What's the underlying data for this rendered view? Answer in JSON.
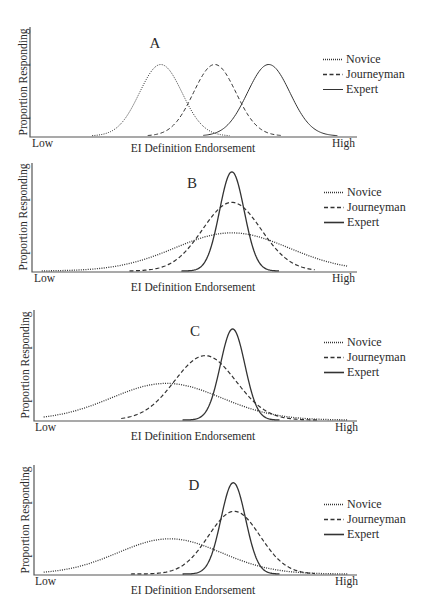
{
  "figure": {
    "width": 427,
    "height": 612
  },
  "colors": {
    "ink": "#333333",
    "axis": "#555555",
    "background": "#ffffff"
  },
  "chart_data": [
    {
      "type": "line",
      "panel": "A",
      "title": "A",
      "xlabel": "EI Definition Endorsement",
      "ylabel": "Proportion Responding",
      "x_tick_labels": [
        "Low",
        "High"
      ],
      "legend": [
        "Novice",
        "Journeyman",
        "Expert"
      ],
      "legend_position": "right",
      "grid": false,
      "xlim": [
        0,
        1
      ],
      "ylim": [
        0,
        1
      ],
      "frame": {
        "axis_x": 30,
        "axis_top": 27,
        "axis_bottom": 137,
        "axis_right": 357,
        "label_x": 155,
        "label_y": 48,
        "low_x": 32,
        "low_y": 147,
        "high_x": 355,
        "high_y": 147,
        "xlabel_x": 193,
        "xlabel_y": 152,
        "ylabel_x": 27,
        "ylabel_y": 82,
        "legend_x": 323,
        "legend_y": 63,
        "legend_dy": 15
      },
      "series": [
        {
          "name": "Novice",
          "style": "dotted",
          "mean": 0.4,
          "sd": 0.065,
          "peak": 0.65,
          "from": 0.19,
          "to": 0.61,
          "width": 1.0
        },
        {
          "name": "Journeyman",
          "style": "dashed",
          "mean": 0.565,
          "sd": 0.065,
          "peak": 0.65,
          "from": 0.36,
          "to": 0.77,
          "width": 1.0
        },
        {
          "name": "Expert",
          "style": "solid",
          "mean": 0.73,
          "sd": 0.065,
          "peak": 0.65,
          "from": 0.53,
          "to": 0.94,
          "width": 1.0
        }
      ]
    },
    {
      "type": "line",
      "panel": "B",
      "title": "B",
      "xlabel": "EI Definition Endorsement",
      "ylabel": "Proportion Responding",
      "x_tick_labels": [
        "Low",
        "High"
      ],
      "legend": [
        "Novice",
        "Journeyman",
        "Expert"
      ],
      "legend_position": "right",
      "grid": false,
      "xlim": [
        0,
        1
      ],
      "ylim": [
        0,
        1
      ],
      "frame": {
        "axis_x": 32,
        "axis_top": 163,
        "axis_bottom": 272,
        "axis_right": 357,
        "label_x": 192,
        "label_y": 188,
        "low_x": 34,
        "low_y": 282,
        "high_x": 355,
        "high_y": 282,
        "xlabel_x": 193,
        "xlabel_y": 291,
        "ylabel_x": 27,
        "ylabel_y": 217,
        "legend_x": 324,
        "legend_y": 196,
        "legend_dy": 15
      },
      "series": [
        {
          "name": "Novice",
          "style": "dotted",
          "mean": 0.615,
          "sd": 0.175,
          "peak": 0.35,
          "from": 0.03,
          "to": 0.97,
          "width": 1.3
        },
        {
          "name": "Journeyman",
          "style": "dashed",
          "mean": 0.615,
          "sd": 0.09,
          "peak": 0.63,
          "from": 0.3,
          "to": 0.87,
          "width": 1.2
        },
        {
          "name": "Expert",
          "style": "solid",
          "mean": 0.615,
          "sd": 0.038,
          "peak": 0.91,
          "from": 0.46,
          "to": 0.76,
          "width": 1.3
        }
      ]
    },
    {
      "type": "line",
      "panel": "C",
      "title": "C",
      "xlabel": "EI Definition Endorsement",
      "ylabel": "Proportion Responding",
      "x_tick_labels": [
        "Low",
        "High"
      ],
      "legend": [
        "Novice",
        "Journeyman",
        "Expert"
      ],
      "legend_position": "right",
      "grid": false,
      "xlim": [
        0,
        1
      ],
      "ylim": [
        0,
        1
      ],
      "frame": {
        "axis_x": 34,
        "axis_top": 310,
        "axis_bottom": 421,
        "axis_right": 357,
        "label_x": 195,
        "label_y": 336,
        "low_x": 35,
        "low_y": 431,
        "high_x": 358,
        "high_y": 431,
        "xlabel_x": 193,
        "xlabel_y": 440,
        "ylabel_x": 29,
        "ylabel_y": 365,
        "legend_x": 324,
        "legend_y": 346,
        "legend_dy": 15
      },
      "series": [
        {
          "name": "Novice",
          "style": "dotted",
          "mean": 0.41,
          "sd": 0.17,
          "peak": 0.33,
          "from": 0.03,
          "to": 0.97,
          "width": 1.3
        },
        {
          "name": "Journeyman",
          "style": "dashed",
          "mean": 0.53,
          "sd": 0.095,
          "peak": 0.58,
          "from": 0.27,
          "to": 0.88,
          "width": 1.2
        },
        {
          "name": "Expert",
          "style": "solid",
          "mean": 0.615,
          "sd": 0.038,
          "peak": 0.82,
          "from": 0.46,
          "to": 0.76,
          "width": 1.3
        }
      ]
    },
    {
      "type": "line",
      "panel": "D",
      "title": "D",
      "xlabel": "EI Definition Endorsement",
      "ylabel": "Proportion Responding",
      "x_tick_labels": [
        "Low",
        "High"
      ],
      "legend": [
        "Novice",
        "Journeyman",
        "Expert"
      ],
      "legend_position": "right",
      "grid": false,
      "xlim": [
        0,
        1
      ],
      "ylim": [
        0,
        1
      ],
      "frame": {
        "axis_x": 34,
        "axis_top": 465,
        "axis_bottom": 575,
        "axis_right": 357,
        "label_x": 194,
        "label_y": 490,
        "low_x": 35,
        "low_y": 585,
        "high_x": 358,
        "high_y": 585,
        "xlabel_x": 193,
        "xlabel_y": 594,
        "ylabel_x": 29,
        "ylabel_y": 520,
        "legend_x": 324,
        "legend_y": 508,
        "legend_dy": 15
      },
      "series": [
        {
          "name": "Novice",
          "style": "dotted",
          "mean": 0.42,
          "sd": 0.16,
          "peak": 0.32,
          "from": 0.03,
          "to": 0.97,
          "width": 1.3
        },
        {
          "name": "Journeyman",
          "style": "dashed",
          "mean": 0.62,
          "sd": 0.08,
          "peak": 0.57,
          "from": 0.3,
          "to": 0.87,
          "width": 1.2
        },
        {
          "name": "Expert",
          "style": "solid",
          "mean": 0.617,
          "sd": 0.038,
          "peak": 0.83,
          "from": 0.46,
          "to": 0.76,
          "width": 1.3
        }
      ]
    }
  ]
}
